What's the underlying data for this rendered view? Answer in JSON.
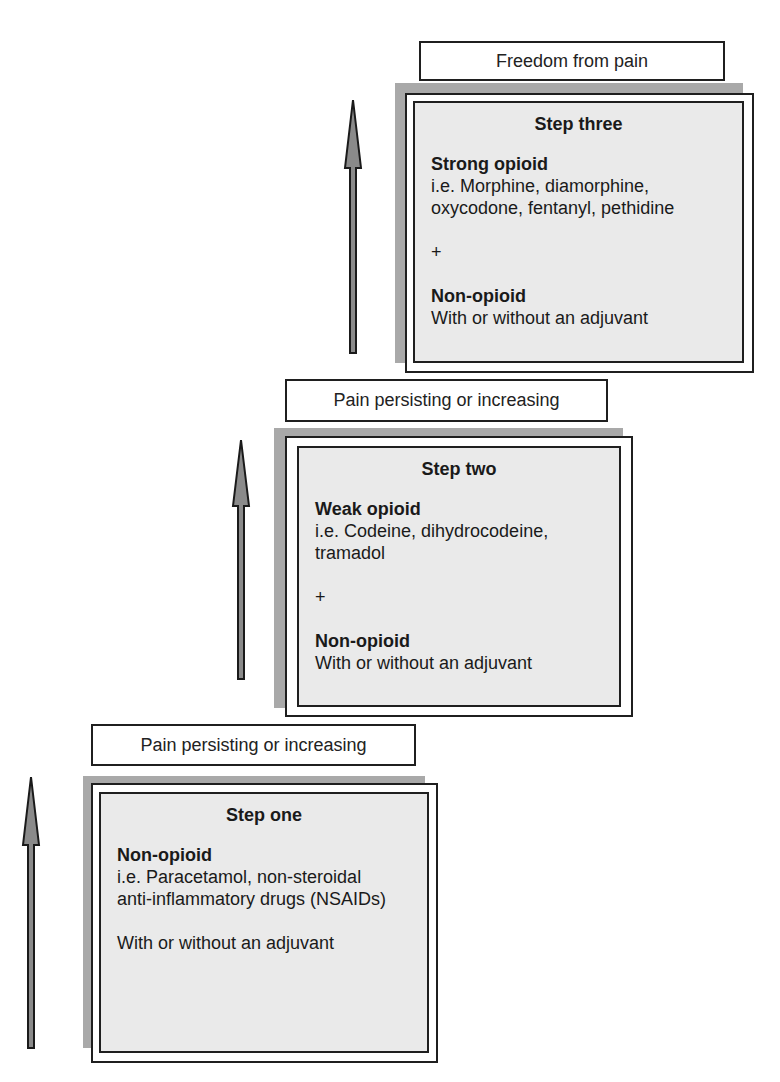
{
  "diagram": {
    "type": "analgesic-ladder",
    "arrow_color": "#8a8a8a",
    "box_fill": "#eaeaea",
    "shadow_color": "#a9a9a9"
  },
  "steps": [
    {
      "label": "Pain persisting or increasing",
      "title": "Step one",
      "drug_class": "Non-opioid",
      "examples_line1": "i.e. Paracetamol, non-steroidal",
      "examples_line2": "anti-inflammatory drugs (NSAIDs)",
      "adjuvant": "With or without an adjuvant"
    },
    {
      "label": "Pain persisting or increasing",
      "title": "Step two",
      "drug_class": "Weak opioid",
      "examples_line1": "i.e. Codeine, dihydrocodeine,",
      "examples_line2": "tramadol",
      "plus": "+",
      "secondary_class": "Non-opioid",
      "adjuvant": "With or without an adjuvant"
    },
    {
      "label": "Freedom from pain",
      "title": "Step three",
      "drug_class": "Strong opioid",
      "examples_line1": "i.e. Morphine, diamorphine,",
      "examples_line2": "oxycodone, fentanyl, pethidine",
      "plus": "+",
      "secondary_class": "Non-opioid",
      "adjuvant": "With or without an adjuvant"
    }
  ]
}
